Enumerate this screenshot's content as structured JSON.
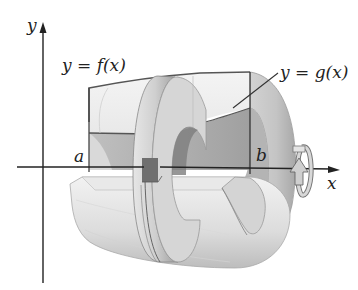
{
  "diagram": {
    "type": "solid-of-revolution-washer",
    "labels": {
      "y_axis": "y",
      "x_axis": "x",
      "f_curve": "y = f(x)",
      "g_curve": "y = g(x)",
      "a": "a",
      "b": "b"
    },
    "colors": {
      "axis": "#222222",
      "outline": "#444444",
      "solid_light": "#eeeeee",
      "solid_mid": "#c8c8c8",
      "solid_dark": "#8a8a8a",
      "background": "#ffffff"
    },
    "icons": [
      "rotation-arrow-icon"
    ]
  }
}
